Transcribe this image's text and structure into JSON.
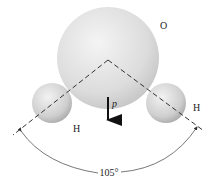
{
  "diagram": {
    "atoms": [
      {
        "label": "O",
        "cx": 108,
        "cy": 58,
        "r": 51,
        "label_x": 160,
        "label_y": 29
      },
      {
        "label": "H",
        "cx": 52,
        "cy": 103,
        "r": 20,
        "label_x": 75,
        "label_y": 132
      },
      {
        "label": "H",
        "cx": 166,
        "cy": 103,
        "r": 20,
        "label_x": 196,
        "label_y": 111
      }
    ],
    "dipole": {
      "label": "p",
      "x": 108,
      "y1": 97,
      "y2": 127
    },
    "angle": {
      "label": "105°",
      "value": 105
    },
    "colors": {
      "sphere_light": "#f2f2f2",
      "sphere_dark": "#b8b8b8",
      "line": "#333333"
    }
  }
}
